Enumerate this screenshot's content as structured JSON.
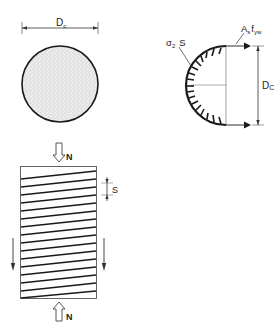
{
  "cross_section": {
    "diameter_label": "D",
    "diameter_sub": "c"
  },
  "free_body": {
    "stress_label": "σ",
    "stress_sub": "2",
    "spacing_label": "S",
    "force_label_main": "A",
    "force_label_sub1": "s",
    "force_label_f": "f",
    "force_label_sub2": "yw",
    "diameter_label": "D",
    "diameter_sub": "C"
  },
  "column": {
    "top_load_label": "N",
    "bottom_load_label": "N",
    "spacing_label": "S"
  },
  "colors": {
    "stroke": "#1a1a1a",
    "fill_concrete": "#e6e6e6",
    "thin_line": "#777777"
  }
}
